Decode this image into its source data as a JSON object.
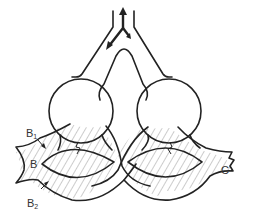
{
  "diagram": {
    "type": "schematic line drawing",
    "colors": {
      "stroke": "#222222",
      "hatch": "#999999",
      "background": "#ffffff"
    },
    "labels": {
      "b1": {
        "main": "B",
        "sub": "1"
      },
      "b": "B",
      "b2": {
        "main": "B",
        "sub": "2"
      },
      "c": "C"
    },
    "elements": [
      "top-y-tube-with-arrows",
      "left-circle",
      "right-circle",
      "twisted-hatched-band",
      "left-lens-opening",
      "right-lens-opening"
    ]
  }
}
